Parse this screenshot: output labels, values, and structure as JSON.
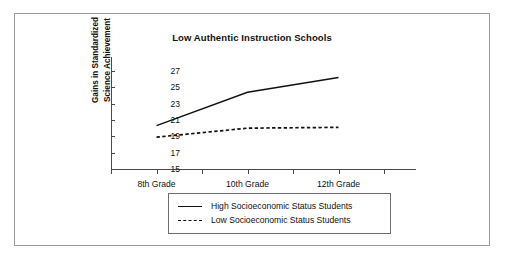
{
  "chart_data": {
    "type": "line",
    "title": "Low Authentic Instruction Schools",
    "xlabel": "",
    "ylabel": "Gains in Standardized Science Achievement",
    "ylabel_lines": [
      "Gains in Standardized",
      "Science Achievement"
    ],
    "categories": [
      "8th Grade",
      "10th Grade",
      "12th Grade"
    ],
    "ytick_labels": [
      "27",
      "25",
      "23",
      "21",
      "19",
      "17",
      "15"
    ],
    "yticks": [
      27,
      25,
      23,
      21,
      19,
      17,
      15
    ],
    "ylim": [
      15,
      27
    ],
    "grid": false,
    "legend_position": "below-plot",
    "series": [
      {
        "name": "High Socioeconomic Status Students",
        "style": "solid",
        "color": "#111111",
        "values": [
          20.3,
          24.4,
          26.2
        ]
      },
      {
        "name": "Low Socioeconomic Status Students",
        "style": "dashed",
        "color": "#111111",
        "values": [
          18.9,
          20.0,
          20.1
        ]
      }
    ]
  },
  "figure": {
    "border_color": "#9a9a9a",
    "axis_color": "#4a4a4a"
  }
}
